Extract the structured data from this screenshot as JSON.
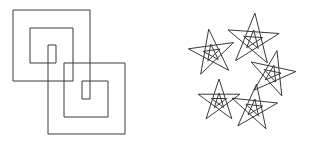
{
  "canvas": {
    "width": 313,
    "height": 142,
    "background": "#ffffff",
    "stroke_color": "#3a3a3a"
  },
  "figures": [
    {
      "name": "interlocking-square-spirals",
      "paths": [
        [
          [
            48,
            134
          ],
          [
            48,
            45
          ],
          [
            56,
            45
          ],
          [
            56,
            63
          ],
          [
            30,
            63
          ],
          [
            30,
            28
          ],
          [
            73,
            28
          ],
          [
            73,
            81
          ],
          [
            13,
            81
          ],
          [
            13,
            10
          ],
          [
            90,
            10
          ],
          [
            90,
            99
          ],
          [
            82,
            99
          ],
          [
            82,
            81
          ],
          [
            108,
            81
          ],
          [
            108,
            117
          ],
          [
            64,
            117
          ],
          [
            64,
            63
          ],
          [
            125,
            63
          ],
          [
            125,
            134
          ],
          [
            48,
            134
          ]
        ]
      ]
    },
    {
      "name": "pentagram-cluster",
      "stars": [
        {
          "cx": 212,
          "cy": 53,
          "r": 24,
          "inner_r": 9,
          "rot": -8
        },
        {
          "cx": 253,
          "cy": 40,
          "r": 27,
          "inner_r": 10,
          "rot": 4
        },
        {
          "cx": 272,
          "cy": 74,
          "r": 24,
          "inner_r": 9,
          "rot": 12
        },
        {
          "cx": 219,
          "cy": 101,
          "r": 22,
          "inner_r": 8,
          "rot": 0
        },
        {
          "cx": 254,
          "cy": 108,
          "r": 24,
          "inner_r": 9,
          "rot": 6
        }
      ]
    }
  ]
}
